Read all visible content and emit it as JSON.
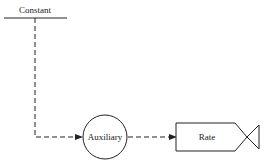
{
  "diagram": {
    "constant": {
      "label": "Constant"
    },
    "auxiliary": {
      "label": "Auxiliary"
    },
    "rate": {
      "label": "Rate"
    },
    "connectors": [
      {
        "from": "Constant",
        "to": "Auxiliary",
        "style": "dashed-arrow"
      },
      {
        "from": "Auxiliary",
        "to": "Rate",
        "style": "dashed-arrow"
      }
    ],
    "colors": {
      "stroke": "#222222",
      "background": "#ffffff"
    }
  }
}
